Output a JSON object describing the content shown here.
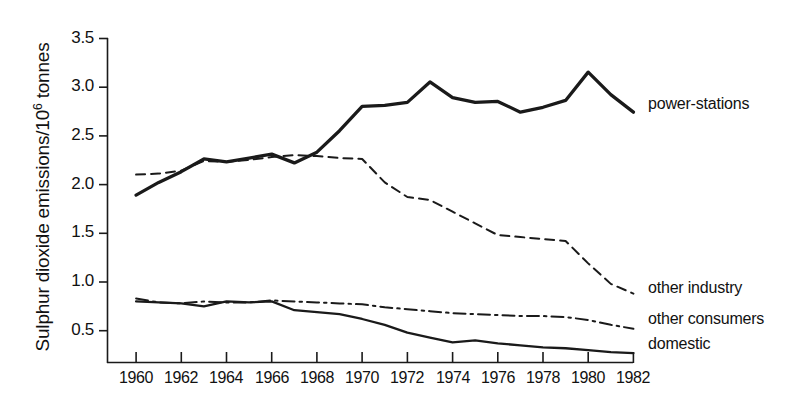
{
  "figure": {
    "background": "#ffffff",
    "ink_color": "#1a1a1a"
  },
  "axes": {
    "y_title_main": "Sulphur dioxide emissions/10",
    "y_title_sup": "6",
    "y_title_tail": " tonnes",
    "y_title_full": "Sulphur dioxide emissions/10⁶ tonnes",
    "y_ticks": [
      "0.5",
      "1.0",
      "1.5",
      "2.0",
      "2.5",
      "3.0",
      "3.5"
    ],
    "x_ticks": [
      "1960",
      "1962",
      "1964",
      "1966",
      "1968",
      "1970",
      "1972",
      "1974",
      "1976",
      "1978",
      "1980",
      "1982"
    ],
    "x_caption": ""
  },
  "series_labels": {
    "power_stations": "power-stations",
    "other_industry": "other industry",
    "other_consumers": "other consumers",
    "domestic": "domestic"
  },
  "chart_data": {
    "type": "line",
    "title": "",
    "xlabel": "",
    "ylabel": "Sulphur dioxide emissions/10⁶ tonnes",
    "xlim": [
      1959,
      1982
    ],
    "ylim": [
      0,
      3.5
    ],
    "xticks": [
      1960,
      1962,
      1964,
      1966,
      1968,
      1970,
      1972,
      1974,
      1976,
      1978,
      1980,
      1982
    ],
    "yticks": [
      0.5,
      1.0,
      1.5,
      2.0,
      2.5,
      3.0,
      3.5
    ],
    "grid": false,
    "legend": "inline-right-of-line-ends",
    "x": [
      1960,
      1961,
      1962,
      1963,
      1964,
      1965,
      1966,
      1967,
      1968,
      1969,
      1970,
      1971,
      1972,
      1973,
      1974,
      1975,
      1976,
      1977,
      1978,
      1979,
      1980,
      1981,
      1982
    ],
    "series": [
      {
        "name": "power-stations",
        "style": "solid-thick",
        "values": [
          1.89,
          2.02,
          2.13,
          2.26,
          2.23,
          2.27,
          2.31,
          2.22,
          2.33,
          2.55,
          2.8,
          2.81,
          2.84,
          3.05,
          2.89,
          2.84,
          2.85,
          2.74,
          2.79,
          2.86,
          3.15,
          2.92,
          2.74
        ]
      },
      {
        "name": "other industry",
        "style": "dashed",
        "values": [
          2.1,
          2.11,
          2.14,
          2.24,
          2.23,
          2.25,
          2.28,
          2.3,
          2.29,
          2.27,
          2.26,
          2.02,
          1.87,
          1.84,
          1.72,
          1.6,
          1.48,
          1.46,
          1.44,
          1.42,
          1.19,
          0.98,
          0.88
        ]
      },
      {
        "name": "other consumers",
        "style": "dash-dot",
        "values": [
          0.83,
          0.79,
          0.78,
          0.8,
          0.79,
          0.79,
          0.81,
          0.8,
          0.79,
          0.78,
          0.77,
          0.74,
          0.72,
          0.7,
          0.68,
          0.67,
          0.66,
          0.65,
          0.65,
          0.64,
          0.61,
          0.56,
          0.52
        ]
      },
      {
        "name": "domestic",
        "style": "solid-thin",
        "values": [
          0.8,
          0.79,
          0.78,
          0.75,
          0.8,
          0.79,
          0.8,
          0.71,
          0.69,
          0.67,
          0.62,
          0.56,
          0.48,
          0.43,
          0.38,
          0.4,
          0.37,
          0.35,
          0.33,
          0.32,
          0.3,
          0.28,
          0.27
        ]
      }
    ]
  }
}
